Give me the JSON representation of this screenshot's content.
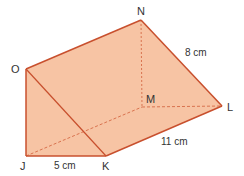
{
  "diagram": {
    "type": "triangular-prism",
    "colors": {
      "fill": "#f7c4a4",
      "edge": "#c8502e",
      "hidden_edge": "#d9734f",
      "label": "#333333"
    },
    "vertices": {
      "O": {
        "label": "O",
        "x": 26,
        "y": 69
      },
      "N": {
        "label": "N",
        "x": 141,
        "y": 20
      },
      "J": {
        "label": "J",
        "x": 26,
        "y": 156
      },
      "K": {
        "label": "K",
        "x": 106,
        "y": 156
      },
      "L": {
        "label": "L",
        "x": 222,
        "y": 106
      },
      "M": {
        "label": "M",
        "x": 142,
        "y": 107
      }
    },
    "dimensions": {
      "JK": "5 cm",
      "KL": "11 cm",
      "NL": "8 cm"
    }
  }
}
